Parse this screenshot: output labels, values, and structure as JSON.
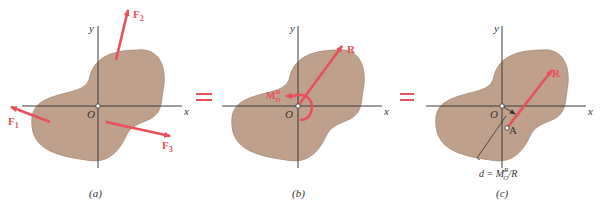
{
  "colors": {
    "body_fill": "#bfa08c",
    "body_stroke": "#a38a78",
    "force": "#e8505b",
    "axis": "#3a3a3a",
    "text": "#333333"
  },
  "panels": [
    {
      "id": "a",
      "caption": "(a)",
      "axis_labels": {
        "x": "x",
        "y": "y",
        "origin": "O"
      },
      "forces": [
        {
          "name": "F",
          "sub": "1"
        },
        {
          "name": "F",
          "sub": "2"
        },
        {
          "name": "F",
          "sub": "3"
        }
      ]
    },
    {
      "id": "b",
      "caption": "(b)",
      "axis_labels": {
        "x": "x",
        "y": "y",
        "origin": "O"
      },
      "resultant": "R",
      "moment": {
        "name": "M",
        "sub": "O",
        "sup": "R"
      }
    },
    {
      "id": "c",
      "caption": "(c)",
      "axis_labels": {
        "x": "x",
        "y": "y",
        "origin": "O"
      },
      "resultant": "R",
      "point": "A",
      "distance_label": {
        "prefix": "d = M",
        "sub": "O",
        "sup": "R",
        "suffix": "/R"
      }
    }
  ],
  "equals": [
    "=",
    "="
  ]
}
